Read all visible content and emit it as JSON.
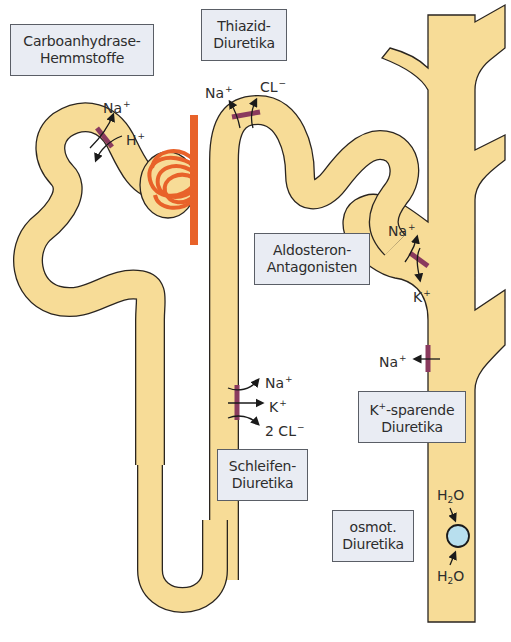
{
  "colors": {
    "tubule_fill": "#f7dc97",
    "tubule_outline": "#2a2520",
    "vessel": "#e8622a",
    "transporter": "#8a3a5e",
    "box_fill": "#e9ecf3",
    "molecule": "#b8dfee"
  },
  "labels": {
    "carboanhydrase": {
      "line1": "Carboanhydrase-",
      "line2": "Hemmstoffe"
    },
    "thiazid": {
      "line1": "Thiazid-",
      "line2": "Diuretika"
    },
    "aldosteron": {
      "line1": "Aldosteron-",
      "line2": "Antagonisten"
    },
    "k_sparende": {
      "line1_prefix": "K",
      "line1_sup": "+",
      "line1_suffix": "-sparende",
      "line2": "Diuretika"
    },
    "schleifen": {
      "line1": "Schleifen-",
      "line2": "Diuretika"
    },
    "osmot": {
      "line1": "osmot.",
      "line2": "Diuretika"
    }
  },
  "ions": {
    "proximal": {
      "na": "Na",
      "na_sup": "+",
      "h": "H",
      "h_sup": "+"
    },
    "distal": {
      "na": "Na",
      "na_sup": "+",
      "cl": "CL",
      "cl_sup": "−"
    },
    "aldosteron": {
      "na": "Na",
      "na_sup": "+",
      "k": "K",
      "k_sup": "+"
    },
    "collecting": {
      "na": "Na",
      "na_sup": "+"
    },
    "loop": {
      "na": "Na",
      "na_sup": "+",
      "k": "K",
      "k_sup": "+",
      "cl": "2 CL",
      "cl_sup": "−"
    },
    "water_top": {
      "h": "H",
      "sub": "2",
      "o": "O"
    },
    "water_bottom": {
      "h": "H",
      "sub": "2",
      "o": "O"
    }
  }
}
